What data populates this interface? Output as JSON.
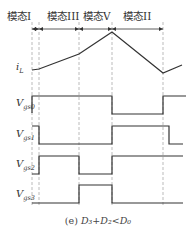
{
  "modes": [
    {
      "label": "模态I",
      "x0": 32,
      "x1": 39,
      "text_x": 7
    },
    {
      "label": "模态III",
      "x0": 39,
      "x1": 79,
      "text_x": 47
    },
    {
      "label": "模态V",
      "x0": 79,
      "x1": 112,
      "text_x": 83
    },
    {
      "label": "模态II",
      "x0": 112,
      "x1": 163,
      "text_x": 123
    }
  ],
  "dashed_lines_x": [
    32,
    39,
    79,
    112,
    163
  ],
  "signals": {
    "iL": {
      "label": "i",
      "sub": "L",
      "points": [
        [
          32,
          70
        ],
        [
          39,
          69
        ],
        [
          79,
          54
        ],
        [
          112,
          32
        ],
        [
          163,
          73
        ],
        [
          182,
          65
        ]
      ]
    },
    "vgs0": {
      "label": "V",
      "sub": "gs0",
      "high_y": 96,
      "low_y": 113,
      "points": [
        [
          32,
          113
        ],
        [
          32,
          96
        ],
        [
          112,
          96
        ],
        [
          112,
          114
        ],
        [
          163,
          114
        ],
        [
          163,
          96
        ],
        [
          186,
          96
        ]
      ]
    },
    "vgs1": {
      "label": "V",
      "sub": "gs1",
      "high_y": 126,
      "low_y": 144,
      "points": [
        [
          32,
          126
        ],
        [
          39,
          126
        ],
        [
          39,
          144
        ],
        [
          112,
          144
        ],
        [
          112,
          126
        ],
        [
          169,
          126
        ],
        [
          169,
          144
        ],
        [
          183,
          144
        ]
      ]
    },
    "vgs2": {
      "label": "V",
      "sub": "gs2",
      "high_y": 156,
      "low_y": 174,
      "points": [
        [
          32,
          174
        ],
        [
          39,
          174
        ],
        [
          39,
          156
        ],
        [
          79,
          156
        ],
        [
          79,
          174
        ],
        [
          112,
          174
        ],
        [
          112,
          156
        ],
        [
          183,
          156
        ]
      ]
    },
    "vgs3": {
      "label": "V",
      "sub": "gs3",
      "high_y": 185,
      "low_y": 203,
      "points": [
        [
          32,
          203
        ],
        [
          79,
          203
        ],
        [
          79,
          185
        ],
        [
          112,
          185
        ],
        [
          112,
          203
        ],
        [
          183,
          203
        ]
      ]
    }
  },
  "caption": {
    "prefix": "(e) ",
    "expr": "D₃+D₂<D₀"
  }
}
